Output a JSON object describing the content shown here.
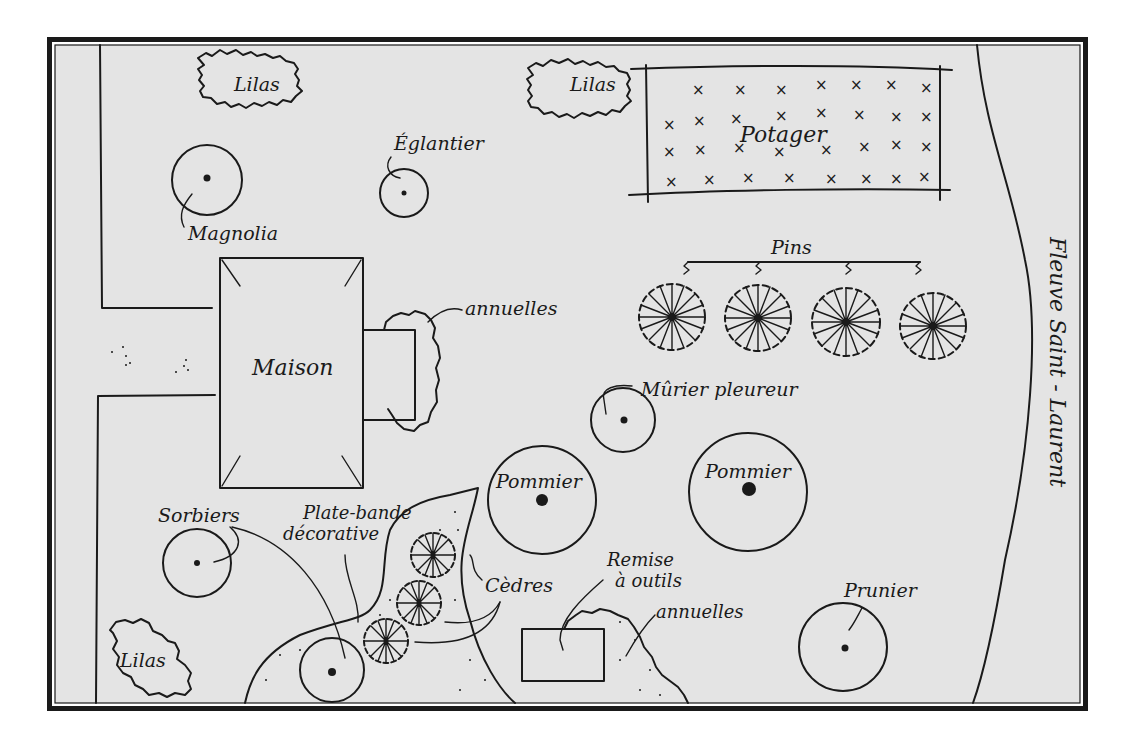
{
  "colors": {
    "paper": "#e4e4e4",
    "ink": "#1a1a1a",
    "background": "#ffffff"
  },
  "labels": {
    "lilas_top_left": "Lilas",
    "lilas_top_center": "Lilas",
    "lilas_bottom_left": "Lilas",
    "potager": "Potager",
    "eglantier": "Églantier",
    "magnolia": "Magnolia",
    "pins": "Pins",
    "maison": "Maison",
    "annuelles_house": "annuelles",
    "murier": "Mûrier pleureur",
    "pommier_left": "Pommier",
    "pommier_right": "Pommier",
    "sorbiers": "Sorbiers",
    "plate_bande_1": "Plate-bande",
    "plate_bande_2": "décorative",
    "cedres": "Cèdres",
    "remise_1": "Remise",
    "remise_2": "à outils",
    "annuelles_shed": "annuelles",
    "prunier": "Prunier",
    "fleuve": "Fleuve Saint - Laurent"
  },
  "potager_grid": {
    "rows": 4,
    "cols": 8,
    "marker": "×"
  }
}
